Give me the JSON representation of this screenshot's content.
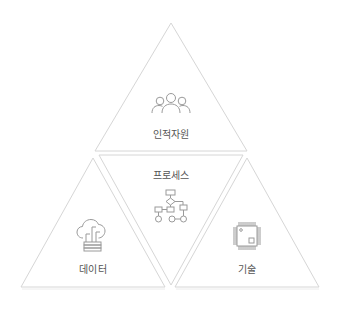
{
  "diagram": {
    "type": "triangle-framework",
    "colors": {
      "stroke": "#d6d6d6",
      "icon": "#9a9a9a",
      "text": "#555555",
      "background": "#ffffff"
    },
    "segments": [
      {
        "id": "human",
        "label": "인적자원",
        "icon": "people-icon",
        "position": "top"
      },
      {
        "id": "process",
        "label": "프로세스",
        "icon": "flowchart-icon",
        "position": "center-inverted"
      },
      {
        "id": "data",
        "label": "데이터",
        "icon": "cloud-data-icon",
        "position": "bottom-left"
      },
      {
        "id": "tech",
        "label": "기술",
        "icon": "chip-icon",
        "position": "bottom-right"
      }
    ]
  }
}
